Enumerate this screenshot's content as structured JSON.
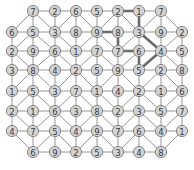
{
  "puzzle": {
    "rows": 8,
    "cols": 9,
    "grid": [
      [
        null,
        7,
        2,
        6,
        5,
        2,
        1,
        7,
        null
      ],
      [
        6,
        5,
        3,
        8,
        9,
        8,
        3,
        9,
        2
      ],
      [
        2,
        9,
        6,
        1,
        7,
        7,
        6,
        4,
        5
      ],
      [
        3,
        8,
        4,
        2,
        5,
        9,
        5,
        2,
        8
      ],
      [
        1,
        5,
        3,
        7,
        1,
        4,
        2,
        1,
        6
      ],
      [
        2,
        1,
        6,
        3,
        8,
        2,
        3,
        5,
        7
      ],
      [
        4,
        7,
        5,
        4,
        9,
        7,
        6,
        4,
        1
      ],
      [
        null,
        6,
        9,
        2,
        5,
        3,
        4,
        8,
        null
      ]
    ],
    "path": [
      [
        0,
        5
      ],
      [
        0,
        6
      ],
      [
        1,
        6
      ],
      [
        2,
        7
      ],
      [
        3,
        6
      ],
      [
        2,
        6
      ],
      [
        2,
        5
      ],
      [
        1,
        5
      ],
      [
        1,
        4
      ]
    ],
    "diagonals": [
      [
        0,
        1,
        1,
        0
      ],
      [
        0,
        1,
        1,
        2
      ],
      [
        0,
        3,
        1,
        2
      ],
      [
        0,
        3,
        1,
        4
      ],
      [
        0,
        5,
        1,
        4
      ],
      [
        0,
        5,
        1,
        6
      ],
      [
        0,
        7,
        1,
        6
      ],
      [
        0,
        7,
        1,
        8
      ],
      [
        1,
        1,
        2,
        0
      ],
      [
        1,
        1,
        2,
        2
      ],
      [
        1,
        2,
        2,
        3
      ],
      [
        1,
        4,
        2,
        3
      ],
      [
        1,
        4,
        2,
        5
      ],
      [
        1,
        6,
        2,
        5
      ],
      [
        1,
        6,
        2,
        7
      ],
      [
        1,
        8,
        2,
        7
      ],
      [
        2,
        0,
        3,
        1
      ],
      [
        2,
        2,
        3,
        1
      ],
      [
        2,
        2,
        3,
        3
      ],
      [
        2,
        4,
        3,
        3
      ],
      [
        2,
        4,
        3,
        5
      ],
      [
        2,
        6,
        3,
        5
      ],
      [
        2,
        7,
        3,
        6
      ],
      [
        2,
        7,
        3,
        8
      ],
      [
        3,
        1,
        4,
        0
      ],
      [
        3,
        1,
        4,
        2
      ],
      [
        3,
        3,
        4,
        2
      ],
      [
        3,
        3,
        4,
        4
      ],
      [
        3,
        5,
        4,
        4
      ],
      [
        3,
        5,
        4,
        6
      ],
      [
        3,
        7,
        4,
        6
      ],
      [
        3,
        7,
        4,
        8
      ],
      [
        4,
        1,
        5,
        0
      ],
      [
        4,
        1,
        5,
        2
      ],
      [
        4,
        3,
        5,
        2
      ],
      [
        4,
        3,
        5,
        4
      ],
      [
        4,
        4,
        5,
        5
      ],
      [
        4,
        6,
        5,
        5
      ],
      [
        4,
        6,
        5,
        7
      ],
      [
        4,
        8,
        5,
        7
      ],
      [
        5,
        0,
        6,
        1
      ],
      [
        5,
        2,
        6,
        1
      ],
      [
        5,
        2,
        6,
        3
      ],
      [
        5,
        4,
        6,
        3
      ],
      [
        5,
        4,
        6,
        5
      ],
      [
        5,
        6,
        6,
        5
      ],
      [
        5,
        6,
        6,
        7
      ],
      [
        5,
        8,
        6,
        7
      ],
      [
        6,
        0,
        7,
        1
      ],
      [
        6,
        2,
        7,
        1
      ],
      [
        6,
        2,
        7,
        3
      ],
      [
        6,
        4,
        7,
        3
      ],
      [
        6,
        4,
        7,
        5
      ],
      [
        6,
        6,
        7,
        5
      ],
      [
        6,
        6,
        7,
        7
      ],
      [
        6,
        8,
        7,
        7
      ]
    ],
    "layout": {
      "x": [
        12,
        33,
        55,
        76,
        97,
        118,
        139,
        161,
        182
      ],
      "y": [
        11,
        32,
        51,
        70,
        91,
        111,
        131,
        152
      ],
      "node_radius": 5.6
    },
    "colors": {
      "node_fill": "#d4d4d4",
      "node_stroke": "#7a7a7a",
      "edge": "#8a8a8a",
      "path": "#6a6a6a",
      "text": "#3a3a3a"
    }
  }
}
